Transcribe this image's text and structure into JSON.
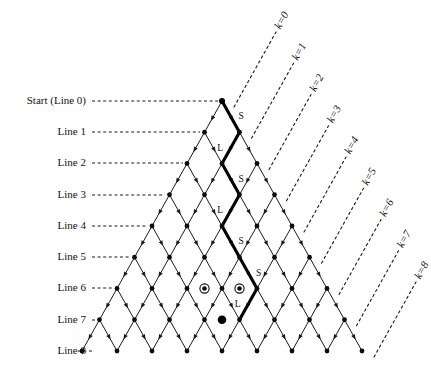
{
  "figure": {
    "type": "lattice-diagram",
    "title": "",
    "geometry": {
      "apex_x": 222,
      "apex_y": 101,
      "half_step_x": 17.5,
      "line_spacing_y": 31.25,
      "num_lines": 8
    }
  },
  "line_labels": [
    {
      "id": "line-0",
      "text": "Start (Line 0)",
      "y": 101,
      "leader_to_x": 222
    },
    {
      "id": "line-1",
      "text": "Line 1",
      "y": 132,
      "leader_to_x": 204
    },
    {
      "id": "line-2",
      "text": "Line 2",
      "y": 163,
      "leader_to_x": 187
    },
    {
      "id": "line-3",
      "text": "Line 3",
      "y": 195,
      "leader_to_x": 169
    },
    {
      "id": "line-4",
      "text": "Line 4",
      "y": 226,
      "leader_to_x": 152
    },
    {
      "id": "line-5",
      "text": "Line 5",
      "y": 257,
      "leader_to_x": 134
    },
    {
      "id": "line-6",
      "text": "Line 6",
      "y": 288,
      "leader_to_x": 117
    },
    {
      "id": "line-7",
      "text": "Line 7",
      "y": 320,
      "leader_to_x": 99
    },
    {
      "id": "line-8",
      "text": "Line 8",
      "y": 351,
      "leader_to_x": 82
    }
  ],
  "k_labels": [
    {
      "id": "k-0",
      "text": "k=0",
      "x": 267,
      "y": 35
    },
    {
      "id": "k-1",
      "text": "k=1",
      "x": 285,
      "y": 66
    },
    {
      "id": "k-2",
      "text": "k=2",
      "x": 303,
      "y": 97
    },
    {
      "id": "k-3",
      "text": "k=3",
      "x": 320,
      "y": 129
    },
    {
      "id": "k-4",
      "text": "k=4",
      "x": 338,
      "y": 160
    },
    {
      "id": "k-5",
      "text": "k=5",
      "x": 355,
      "y": 191
    },
    {
      "id": "k-6",
      "text": "k=6",
      "x": 373,
      "y": 222
    },
    {
      "id": "k-7",
      "text": "k=7",
      "x": 390,
      "y": 254
    },
    {
      "id": "k-8",
      "text": "k=8",
      "x": 408,
      "y": 285
    }
  ],
  "path": {
    "description": "highlighted walk from Start (Line 0) to Line 7",
    "start": {
      "line": 0,
      "offset": 0
    },
    "steps": [
      {
        "label": "S",
        "direction": "right-down",
        "from_line": 0,
        "to_line": 1
      },
      {
        "label": "L",
        "direction": "left-down",
        "from_line": 1,
        "to_line": 2
      },
      {
        "label": "S",
        "direction": "right-down",
        "from_line": 2,
        "to_line": 3
      },
      {
        "label": "L",
        "direction": "left-down",
        "from_line": 3,
        "to_line": 4
      },
      {
        "label": "S",
        "direction": "right-down",
        "from_line": 4,
        "to_line": 5
      },
      {
        "label": "S",
        "direction": "right-down",
        "from_line": 5,
        "to_line": 6
      },
      {
        "label": "L",
        "direction": "left-down",
        "from_line": 6,
        "to_line": 7
      }
    ]
  },
  "marked_nodes": [
    {
      "id": "ring-left",
      "line": 6,
      "offset": -1,
      "style": "circled"
    },
    {
      "id": "ring-right",
      "line": 6,
      "offset": 1,
      "style": "circled"
    },
    {
      "id": "terminal",
      "line": 7,
      "offset": 0,
      "style": "filled-large"
    }
  ],
  "colors": {
    "ink": "#111111",
    "lattice": "#1a1a1a",
    "path": "#000000",
    "background": "#ffffff"
  }
}
